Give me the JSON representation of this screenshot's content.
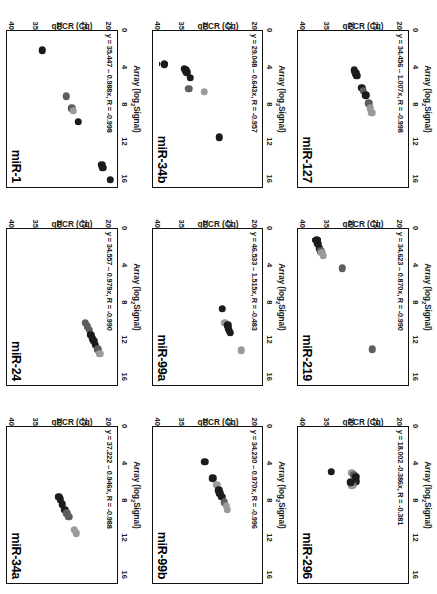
{
  "figure": {
    "axis_titles": {
      "y": "Array (log",
      "y_sub": "2",
      "y_tail": "Signal)",
      "x": "qPCR (Cq)"
    },
    "y_ticks": [
      "0",
      "4",
      "8",
      "12",
      "16"
    ],
    "x_ticks": [
      "20",
      "25",
      "30",
      "35",
      "40"
    ],
    "colors": {
      "point_dark": "#1b1b1b",
      "point_mid": "#5e5e5e",
      "point_light": "#9a9a9a",
      "axis": "#111111",
      "background": "#ffffff"
    }
  },
  "chart_data": {
    "type": "scatter",
    "title": "",
    "xlabel": "qPCR (Cq)",
    "ylabel": "Array (log2 Signal)",
    "xlim": [
      18,
      41
    ],
    "ylim": [
      0,
      17
    ],
    "grid": false,
    "legend": "none",
    "panels": [
      {
        "name": "miR-127",
        "equation": "y = 34.456 – 1.007x, R = -0.998",
        "slope": -1.007,
        "intercept": 34.456,
        "r": -0.998,
        "points": [
          {
            "x": 29.3,
            "y": 4.3,
            "shade": "dark"
          },
          {
            "x": 29.0,
            "y": 4.6,
            "shade": "dark"
          },
          {
            "x": 28.8,
            "y": 4.9,
            "shade": "dark"
          },
          {
            "x": 27.7,
            "y": 6.2,
            "shade": "dark"
          },
          {
            "x": 27.4,
            "y": 6.5,
            "shade": "mid"
          },
          {
            "x": 26.9,
            "y": 7.0,
            "shade": "dark"
          },
          {
            "x": 26.2,
            "y": 7.9,
            "shade": "mid"
          },
          {
            "x": 25.9,
            "y": 8.4,
            "shade": "light"
          },
          {
            "x": 25.6,
            "y": 8.9,
            "shade": "light"
          }
        ]
      },
      {
        "name": "miR-219",
        "equation": "y = 34.623 – 0.870x, R = -0.990",
        "slope": -0.87,
        "intercept": 34.623,
        "r": -0.99,
        "points": [
          {
            "x": 37.1,
            "y": 1.2,
            "shade": "dark"
          },
          {
            "x": 36.9,
            "y": 1.6,
            "shade": "dark"
          },
          {
            "x": 36.6,
            "y": 2.1,
            "shade": "dark"
          },
          {
            "x": 36.3,
            "y": 2.4,
            "shade": "mid"
          },
          {
            "x": 36.1,
            "y": 2.6,
            "shade": "light"
          },
          {
            "x": 35.8,
            "y": 2.9,
            "shade": "light"
          },
          {
            "x": 31.8,
            "y": 4.3,
            "shade": "mid"
          },
          {
            "x": 25.5,
            "y": 13.1,
            "shade": "mid"
          }
        ],
        "error_bars": [
          {
            "x": 37.1,
            "y": 1.2,
            "err": 0.9
          }
        ]
      },
      {
        "name": "miR-296",
        "equation": "y = 18.002 -0.386x, R = -0.381",
        "slope": -0.386,
        "intercept": 18.002,
        "r": -0.381,
        "points": [
          {
            "x": 34.1,
            "y": 4.9,
            "shade": "dark"
          },
          {
            "x": 29.8,
            "y": 5.0,
            "shade": "light"
          },
          {
            "x": 29.4,
            "y": 5.2,
            "shade": "mid"
          },
          {
            "x": 29.0,
            "y": 5.4,
            "shade": "dark"
          },
          {
            "x": 28.9,
            "y": 5.9,
            "shade": "dark"
          },
          {
            "x": 29.6,
            "y": 6.3,
            "shade": "mid"
          },
          {
            "x": 29.8,
            "y": 6.4,
            "shade": "light"
          },
          {
            "x": 30.0,
            "y": 6.0,
            "shade": "dark"
          }
        ]
      },
      {
        "name": "miR-34b",
        "equation": "y = 29.048 – 0.643x, R = -0.957",
        "slope": -0.643,
        "intercept": 29.048,
        "r": -0.957,
        "points": [
          {
            "x": 38.6,
            "y": 3.6,
            "shade": "dark"
          },
          {
            "x": 34.4,
            "y": 4.1,
            "shade": "dark"
          },
          {
            "x": 34.1,
            "y": 4.3,
            "shade": "dark"
          },
          {
            "x": 33.9,
            "y": 4.5,
            "shade": "dark"
          },
          {
            "x": 33.1,
            "y": 5.1,
            "shade": "dark"
          },
          {
            "x": 33.4,
            "y": 6.3,
            "shade": "mid"
          },
          {
            "x": 30.2,
            "y": 6.6,
            "shade": "light"
          },
          {
            "x": 27.0,
            "y": 11.6,
            "shade": "dark"
          }
        ],
        "error_bars": [
          {
            "x": 38.6,
            "y": 3.6,
            "err": 0.9
          }
        ]
      },
      {
        "name": "miR-99a",
        "equation": "y = 46.533 – 1.515x, R = -0.483",
        "slope": -1.515,
        "intercept": 46.533,
        "r": -0.483,
        "points": [
          {
            "x": 25.9,
            "y": 10.2,
            "shade": "light"
          },
          {
            "x": 26.4,
            "y": 8.7,
            "shade": "dark"
          },
          {
            "x": 25.3,
            "y": 10.5,
            "shade": "dark"
          },
          {
            "x": 25.1,
            "y": 10.8,
            "shade": "dark"
          },
          {
            "x": 24.9,
            "y": 11.1,
            "shade": "dark"
          },
          {
            "x": 24.7,
            "y": 11.3,
            "shade": "dark"
          },
          {
            "x": 22.4,
            "y": 13.2,
            "shade": "light"
          }
        ]
      },
      {
        "name": "miR-99b",
        "equation": "y = 34.230 – 0.970x, R = -0.996",
        "slope": -0.97,
        "intercept": 34.23,
        "r": -0.996,
        "points": [
          {
            "x": 30.1,
            "y": 3.8,
            "shade": "dark"
          },
          {
            "x": 28.4,
            "y": 5.6,
            "shade": "dark"
          },
          {
            "x": 27.6,
            "y": 6.3,
            "shade": "light"
          },
          {
            "x": 27.1,
            "y": 6.9,
            "shade": "dark"
          },
          {
            "x": 26.9,
            "y": 7.2,
            "shade": "dark"
          },
          {
            "x": 26.5,
            "y": 7.6,
            "shade": "dark"
          },
          {
            "x": 26.0,
            "y": 8.2,
            "shade": "mid"
          },
          {
            "x": 25.6,
            "y": 8.6,
            "shade": "light"
          },
          {
            "x": 25.4,
            "y": 9.0,
            "shade": "light"
          }
        ]
      },
      {
        "name": "miR-1",
        "equation": "y = 35.447 – 0.988x, R = -0.998",
        "slope": -0.988,
        "intercept": 35.447,
        "r": -0.998,
        "points": [
          {
            "x": 33.6,
            "y": 2.1,
            "shade": "dark"
          },
          {
            "x": 28.6,
            "y": 7.1,
            "shade": "mid"
          },
          {
            "x": 27.4,
            "y": 8.4,
            "shade": "mid"
          },
          {
            "x": 27.1,
            "y": 8.7,
            "shade": "light"
          },
          {
            "x": 26.1,
            "y": 9.9,
            "shade": "dark"
          },
          {
            "x": 21.1,
            "y": 14.6,
            "shade": "dark"
          },
          {
            "x": 20.9,
            "y": 14.9,
            "shade": "dark"
          },
          {
            "x": 19.3,
            "y": 16.2,
            "shade": "dark"
          }
        ],
        "error_bars": [
          {
            "x": 33.6,
            "y": 2.1,
            "err": 0.5
          }
        ]
      },
      {
        "name": "miR-24",
        "equation": "y = 34.557 – 0.979x, R = -0.990",
        "slope": -0.979,
        "intercept": 34.557,
        "r": -0.99,
        "points": [
          {
            "x": 24.6,
            "y": 10.2,
            "shade": "mid"
          },
          {
            "x": 24.2,
            "y": 10.6,
            "shade": "mid"
          },
          {
            "x": 23.8,
            "y": 11.0,
            "shade": "mid"
          },
          {
            "x": 23.4,
            "y": 11.5,
            "shade": "dark"
          },
          {
            "x": 23.1,
            "y": 11.9,
            "shade": "dark"
          },
          {
            "x": 22.8,
            "y": 12.2,
            "shade": "dark"
          },
          {
            "x": 22.5,
            "y": 12.6,
            "shade": "dark"
          },
          {
            "x": 22.0,
            "y": 13.1,
            "shade": "mid"
          },
          {
            "x": 21.6,
            "y": 13.6,
            "shade": "light"
          }
        ]
      },
      {
        "name": "miR-34a",
        "equation": "y = 37.222 – 0.946x, R = -0.988",
        "slope": -0.946,
        "intercept": 37.222,
        "r": -0.988,
        "points": [
          {
            "x": 30.1,
            "y": 7.6,
            "shade": "dark"
          },
          {
            "x": 29.8,
            "y": 7.9,
            "shade": "dark"
          },
          {
            "x": 29.4,
            "y": 8.4,
            "shade": "dark"
          },
          {
            "x": 28.9,
            "y": 9.0,
            "shade": "dark"
          },
          {
            "x": 28.5,
            "y": 9.4,
            "shade": "mid"
          },
          {
            "x": 28.1,
            "y": 9.8,
            "shade": "mid"
          },
          {
            "x": 26.9,
            "y": 11.2,
            "shade": "light"
          },
          {
            "x": 26.5,
            "y": 11.6,
            "shade": "light"
          }
        ]
      }
    ]
  }
}
